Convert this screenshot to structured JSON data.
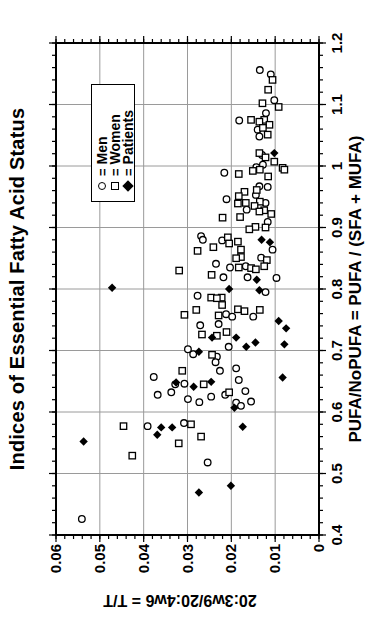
{
  "chart_data": {
    "type": "scatter",
    "title": "Indices of Essential Fatty Acid Status",
    "xlabel": "PUFA/NoPUFA = PUFA / (SFA + MUFA)",
    "ylabel": "20:3w9/20:4w6 = T/T",
    "xlim": [
      0.4,
      1.2
    ],
    "ylim": [
      0,
      0.06
    ],
    "xticks": {
      "values": [
        0.4,
        0.5,
        0.6,
        0.7,
        0.8,
        0.9,
        1.0,
        1.1,
        1.2
      ],
      "labels": [
        "0.4",
        "0.5",
        "0.6",
        "0.7",
        "0.8",
        "0.9",
        "1",
        "1.1",
        "1.2"
      ]
    },
    "yticks": {
      "values": [
        0,
        0.01,
        0.02,
        0.03,
        0.04,
        0.05,
        0.06
      ],
      "labels": [
        "0",
        "0.01",
        "0.02",
        "0.03",
        "0.04",
        "0.05",
        "0.06"
      ]
    },
    "x_minor_step": 0.02,
    "y_minor_step": 0.002,
    "grid": true,
    "orientation": "figure rotated 90deg counterclockwise (portrait)",
    "colors": {
      "marker": "#000000",
      "grid": "#9a9a9a",
      "frame": "#000000",
      "background": "#ffffff"
    },
    "legend": {
      "position": "upper-right-inside",
      "separator": "=",
      "entries": [
        {
          "symbol": "circle-open",
          "label": "Men"
        },
        {
          "symbol": "square-open",
          "label": "Women"
        },
        {
          "symbol": "diamond-filled",
          "label": "Patients"
        }
      ]
    },
    "series": [
      {
        "name": "Men",
        "marker": "circle-open",
        "points": [
          [
            1.156,
            0.0135
          ],
          [
            1.149,
            0.011
          ],
          [
            1.107,
            0.0102
          ],
          [
            1.086,
            0.0121
          ],
          [
            1.074,
            0.0182
          ],
          [
            1.059,
            0.014
          ],
          [
            1.048,
            0.0136
          ],
          [
            1.018,
            0.013
          ],
          [
            1.002,
            0.0128
          ],
          [
            0.998,
            0.0143
          ],
          [
            0.989,
            0.0216
          ],
          [
            0.967,
            0.0136
          ],
          [
            0.966,
            0.0117
          ],
          [
            0.953,
            0.0144
          ],
          [
            0.946,
            0.0211
          ],
          [
            0.94,
            0.0122
          ],
          [
            0.929,
            0.0165
          ],
          [
            0.909,
            0.0117
          ],
          [
            0.886,
            0.0269
          ],
          [
            0.88,
            0.0265
          ],
          [
            0.879,
            0.0221
          ],
          [
            0.864,
            0.0106
          ],
          [
            0.851,
            0.0132
          ],
          [
            0.841,
            0.0235
          ],
          [
            0.837,
            0.0167
          ],
          [
            0.835,
            0.0203
          ],
          [
            0.819,
            0.0218
          ],
          [
            0.819,
            0.0163
          ],
          [
            0.818,
            0.0097
          ],
          [
            0.789,
            0.0277
          ],
          [
            0.795,
            0.0122
          ],
          [
            0.759,
            0.0212
          ],
          [
            0.755,
            0.0198
          ],
          [
            0.755,
            0.015
          ],
          [
            0.743,
            0.0229
          ],
          [
            0.741,
            0.0271
          ],
          [
            0.706,
            0.0206
          ],
          [
            0.702,
            0.0299
          ],
          [
            0.694,
            0.0287
          ],
          [
            0.69,
            0.0233
          ],
          [
            0.681,
            0.0236
          ],
          [
            0.671,
            0.0189
          ],
          [
            0.667,
            0.0226
          ],
          [
            0.657,
            0.0377
          ],
          [
            0.652,
            0.0183
          ],
          [
            0.646,
            0.0307
          ],
          [
            0.645,
            0.0328
          ],
          [
            0.634,
            0.0168
          ],
          [
            0.632,
            0.0337
          ],
          [
            0.628,
            0.0368
          ],
          [
            0.628,
            0.0214
          ],
          [
            0.625,
            0.0246
          ],
          [
            0.621,
            0.0299
          ],
          [
            0.617,
            0.0155
          ],
          [
            0.616,
            0.0273
          ],
          [
            0.615,
            0.0189
          ],
          [
            0.61,
            0.0178
          ],
          [
            0.582,
            0.0308
          ],
          [
            0.577,
            0.0391
          ],
          [
            0.518,
            0.0254
          ],
          [
            0.426,
            0.0541
          ]
        ]
      },
      {
        "name": "Women",
        "marker": "square-open",
        "points": [
          [
            1.14,
            0.0106
          ],
          [
            1.124,
            0.0116
          ],
          [
            1.102,
            0.0129
          ],
          [
            1.096,
            0.0092
          ],
          [
            1.075,
            0.0155
          ],
          [
            1.075,
            0.0125
          ],
          [
            1.072,
            0.0136
          ],
          [
            1.067,
            0.0113
          ],
          [
            1.062,
            0.0128
          ],
          [
            1.051,
            0.0117
          ],
          [
            1.021,
            0.0136
          ],
          [
            1.014,
            0.0122
          ],
          [
            1.007,
            0.0102
          ],
          [
            0.997,
            0.0083
          ],
          [
            0.994,
            0.0135
          ],
          [
            0.994,
            0.0079
          ],
          [
            0.992,
            0.0151
          ],
          [
            0.987,
            0.0183
          ],
          [
            0.983,
            0.0116
          ],
          [
            0.961,
            0.0142
          ],
          [
            0.958,
            0.017
          ],
          [
            0.951,
            0.0183
          ],
          [
            0.942,
            0.0135
          ],
          [
            0.94,
            0.0167
          ],
          [
            0.939,
            0.0185
          ],
          [
            0.935,
            0.0147
          ],
          [
            0.928,
            0.0125
          ],
          [
            0.926,
            0.0136
          ],
          [
            0.922,
            0.0109
          ],
          [
            0.917,
            0.018
          ],
          [
            0.916,
            0.022
          ],
          [
            0.901,
            0.0145
          ],
          [
            0.9,
            0.0122
          ],
          [
            0.897,
            0.0159
          ],
          [
            0.884,
            0.0208
          ],
          [
            0.877,
            0.0185
          ],
          [
            0.874,
            0.0205
          ],
          [
            0.868,
            0.0241
          ],
          [
            0.864,
            0.0178
          ],
          [
            0.862,
            0.0277
          ],
          [
            0.852,
            0.0178
          ],
          [
            0.85,
            0.0189
          ],
          [
            0.847,
            0.0119
          ],
          [
            0.837,
            0.0125
          ],
          [
            0.835,
            0.0183
          ],
          [
            0.834,
            0.0155
          ],
          [
            0.832,
            0.0144
          ],
          [
            0.83,
            0.0319
          ],
          [
            0.823,
            0.0245
          ],
          [
            0.786,
            0.0246
          ],
          [
            0.786,
            0.0222
          ],
          [
            0.785,
            0.0233
          ],
          [
            0.774,
            0.0221
          ],
          [
            0.767,
            0.0185
          ],
          [
            0.766,
            0.028
          ],
          [
            0.766,
            0.0135
          ],
          [
            0.764,
            0.017
          ],
          [
            0.758,
            0.0307
          ],
          [
            0.757,
            0.0229
          ],
          [
            0.73,
            0.0211
          ],
          [
            0.726,
            0.0267
          ],
          [
            0.724,
            0.0233
          ],
          [
            0.693,
            0.0244
          ],
          [
            0.667,
            0.0312
          ],
          [
            0.645,
            0.0263
          ],
          [
            0.632,
            0.0205
          ],
          [
            0.58,
            0.0292
          ],
          [
            0.577,
            0.0446
          ],
          [
            0.56,
            0.0269
          ],
          [
            0.549,
            0.032
          ],
          [
            0.529,
            0.0426
          ]
        ]
      },
      {
        "name": "Patients",
        "marker": "diamond-filled",
        "points": [
          [
            1.021,
            0.0102
          ],
          [
            0.88,
            0.0131
          ],
          [
            0.876,
            0.0112
          ],
          [
            0.815,
            0.0142
          ],
          [
            0.802,
            0.0472
          ],
          [
            0.8,
            0.0205
          ],
          [
            0.798,
            0.0136
          ],
          [
            0.748,
            0.0092
          ],
          [
            0.736,
            0.0075
          ],
          [
            0.721,
            0.0244
          ],
          [
            0.721,
            0.0189
          ],
          [
            0.713,
            0.0145
          ],
          [
            0.71,
            0.0079
          ],
          [
            0.706,
            0.0166
          ],
          [
            0.698,
            0.0274
          ],
          [
            0.656,
            0.0083
          ],
          [
            0.649,
            0.0246
          ],
          [
            0.648,
            0.0326
          ],
          [
            0.641,
            0.0286
          ],
          [
            0.607,
            0.0193
          ],
          [
            0.576,
            0.0174
          ],
          [
            0.575,
            0.036
          ],
          [
            0.575,
            0.0335
          ],
          [
            0.563,
            0.0369
          ],
          [
            0.552,
            0.0537
          ],
          [
            0.48,
            0.0201
          ],
          [
            0.469,
            0.0274
          ]
        ]
      }
    ]
  }
}
